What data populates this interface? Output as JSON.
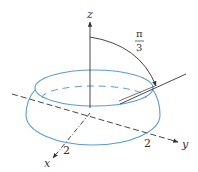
{
  "figure": {
    "labels": {
      "z_axis": "z",
      "y_axis": "y",
      "x_axis": "x",
      "angle_numerator": "π",
      "angle_denominator": "3",
      "x_tick": "2",
      "y_tick": "2"
    },
    "colors": {
      "solid": "#5b9bd5",
      "axes": "#333333"
    }
  }
}
